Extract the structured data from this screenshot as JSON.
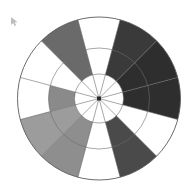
{
  "canvas": {
    "width": 195,
    "height": 188,
    "background": "#ffffff"
  },
  "cursor": {
    "name": "mouse-pointer",
    "x": 13,
    "y": 22,
    "color": "#9a9a9a"
  },
  "chart_data": {
    "type": "pie",
    "subtype": "polar-wedge-rose",
    "title": "",
    "subtitle": "",
    "xlabel": "",
    "ylabel": "",
    "grid": true,
    "legend_position": "none",
    "center": {
      "cx": 99,
      "cy": 98.5
    },
    "outer_radius": 81.5,
    "sector_count": 12,
    "sector_angle_deg": 30,
    "start_angle_deg": -90,
    "ring_count": 3,
    "ring_radii": [
      24.5,
      50.5,
      81.5
    ],
    "ring_labels": [
      "1",
      "2",
      "3"
    ],
    "grid_stroke": "#6b6b6b",
    "grid_stroke_width": 0.6,
    "outline_stroke": "#5a5a5a",
    "outline_stroke_width": 0.9,
    "empty_fill": "#ffffff",
    "center_dot": {
      "radius": 2.0,
      "color": "#2b2b2b"
    },
    "categories": [
      "S1",
      "S2",
      "S3",
      "S4",
      "S5",
      "S6",
      "S7",
      "S8",
      "S9",
      "S10",
      "S11",
      "S12"
    ],
    "values": [
      0,
      2,
      3,
      2,
      0,
      2,
      2,
      0,
      2,
      2,
      2,
      0
    ],
    "colors": [
      "#ffffff",
      "#3a3a3a",
      "#2e2e2e",
      "#3d3d3d",
      "#ffffff",
      "#4a4a4a",
      "#8e8e8e",
      "#ffffff",
      "#9c9c9c",
      "#7b7b7b",
      "#6a6a6a",
      "#ffffff"
    ],
    "wedges": [
      {
        "index": 0,
        "label": "S1",
        "start_deg": -105,
        "end_deg": -75,
        "inner_radius": 0,
        "outer_radius": 0,
        "value": 0,
        "color": "#ffffff",
        "filled": false
      },
      {
        "index": 1,
        "label": "S2",
        "start_deg": -75,
        "end_deg": -45,
        "inner_radius": 24.5,
        "outer_radius": 81.5,
        "value": 2,
        "color": "#3a3a3a",
        "filled": true
      },
      {
        "index": 2,
        "label": "S3",
        "start_deg": -45,
        "end_deg": -15,
        "inner_radius": 24.5,
        "outer_radius": 81.5,
        "value": 2,
        "color": "#2e2e2e",
        "filled": true
      },
      {
        "index": 3,
        "label": "S4",
        "start_deg": -15,
        "end_deg": 15,
        "inner_radius": 24.5,
        "outer_radius": 81.5,
        "value": 2,
        "color": "#2e2e2e",
        "filled": true
      },
      {
        "index": 4,
        "label": "S5",
        "start_deg": 15,
        "end_deg": 45,
        "inner_radius": 0,
        "outer_radius": 0,
        "value": 0,
        "color": "#ffffff",
        "filled": false
      },
      {
        "index": 5,
        "label": "S6",
        "start_deg": 45,
        "end_deg": 75,
        "inner_radius": 24.5,
        "outer_radius": 81.5,
        "value": 2,
        "color": "#4a4a4a",
        "filled": true
      },
      {
        "index": 6,
        "label": "S7",
        "start_deg": 75,
        "end_deg": 105,
        "inner_radius": 0,
        "outer_radius": 0,
        "value": 0,
        "color": "#ffffff",
        "filled": false
      },
      {
        "index": 7,
        "label": "S8",
        "start_deg": 105,
        "end_deg": 135,
        "inner_radius": 24.5,
        "outer_radius": 81.5,
        "value": 2,
        "color": "#8e8e8e",
        "filled": true
      },
      {
        "index": 8,
        "label": "S9",
        "start_deg": 135,
        "end_deg": 165,
        "inner_radius": 24.5,
        "outer_radius": 81.5,
        "value": 2,
        "color": "#9c9c9c",
        "filled": true
      },
      {
        "index": 9,
        "label": "S10",
        "start_deg": 165,
        "end_deg": 195,
        "inner_radius": 24.5,
        "outer_radius": 50.5,
        "value": 1,
        "color": "#8a8a8a",
        "filled": true
      },
      {
        "index": 10,
        "label": "S11",
        "start_deg": 195,
        "end_deg": 225,
        "inner_radius": 0,
        "outer_radius": 0,
        "value": 0,
        "color": "#ffffff",
        "filled": false
      },
      {
        "index": 11,
        "label": "S12",
        "start_deg": 225,
        "end_deg": 255,
        "inner_radius": 24.5,
        "outer_radius": 81.5,
        "value": 2,
        "color": "#6a6a6a",
        "filled": true
      }
    ]
  }
}
